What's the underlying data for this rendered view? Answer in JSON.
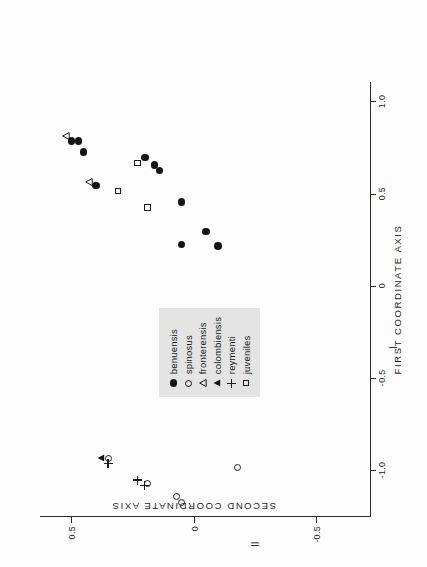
{
  "figure": {
    "background_color": "#fdfdfd",
    "ink_color": "#1b1b1b",
    "legend_background": "#e4e4e4",
    "orientation_note": "rotated"
  },
  "chart_data": {
    "type": "scatter",
    "title": "",
    "xlabel": "FIRST  COORDINATE  AXIS",
    "ylabel": "SECOND  COORDINATE  AXIS",
    "xlim": [
      -1.25,
      1.1
    ],
    "ylim": [
      -0.72,
      0.62
    ],
    "grid": false,
    "legend_position": "center-left",
    "axis_roman_x": "I",
    "axis_roman_y": "II",
    "xticks": [
      {
        "value": -1.0,
        "label": "-1.0"
      },
      {
        "value": -0.5,
        "label": "-0.5"
      },
      {
        "value": 0.0,
        "label": "0"
      },
      {
        "value": 0.5,
        "label": "0.5"
      },
      {
        "value": 1.0,
        "label": "1.0"
      }
    ],
    "yticks": [
      {
        "value": -0.5,
        "label": "-0.5"
      },
      {
        "value": 0.0,
        "label": "0"
      },
      {
        "value": 0.5,
        "label": "0.5"
      }
    ],
    "series": [
      {
        "name": "benuensis",
        "marker": "filled-circle",
        "points": [
          [
            0.79,
            0.5
          ],
          [
            0.79,
            0.47
          ],
          [
            0.73,
            0.45
          ],
          [
            0.55,
            0.4
          ],
          [
            0.7,
            0.2
          ],
          [
            0.66,
            0.16
          ],
          [
            0.63,
            0.14
          ],
          [
            0.46,
            0.05
          ],
          [
            0.3,
            -0.05
          ],
          [
            0.23,
            0.05
          ],
          [
            0.22,
            -0.1
          ]
        ]
      },
      {
        "name": "spinosus",
        "marker": "open-circle",
        "points": [
          [
            -0.93,
            0.35
          ],
          [
            -1.07,
            0.19
          ],
          [
            -1.14,
            0.07
          ],
          [
            -1.17,
            0.05
          ],
          [
            -0.98,
            -0.18
          ]
        ]
      },
      {
        "name": "fronterensis",
        "marker": "open-triangle",
        "points": [
          [
            0.82,
            0.52
          ],
          [
            0.57,
            0.43
          ]
        ]
      },
      {
        "name": "colombiensis",
        "marker": "filled-triangle",
        "points": [
          [
            -0.93,
            0.38
          ]
        ]
      },
      {
        "name": "reymenti",
        "marker": "plus",
        "points": [
          [
            -0.96,
            0.35
          ],
          [
            -1.05,
            0.23
          ],
          [
            -1.08,
            0.2
          ]
        ]
      },
      {
        "name": "juveniles",
        "marker": "open-square",
        "points": [
          [
            0.67,
            0.23
          ],
          [
            0.52,
            0.31
          ],
          [
            0.43,
            0.19
          ]
        ]
      }
    ],
    "legend_entries": [
      {
        "label": "benuensis",
        "marker": "filled-circle"
      },
      {
        "label": "spinosus",
        "marker": "open-circle"
      },
      {
        "label": "fronterensis",
        "marker": "open-triangle"
      },
      {
        "label": "colombiensis",
        "marker": "filled-triangle"
      },
      {
        "label": "reymenti",
        "marker": "plus"
      },
      {
        "label": "juveniles",
        "marker": "open-square"
      }
    ]
  }
}
